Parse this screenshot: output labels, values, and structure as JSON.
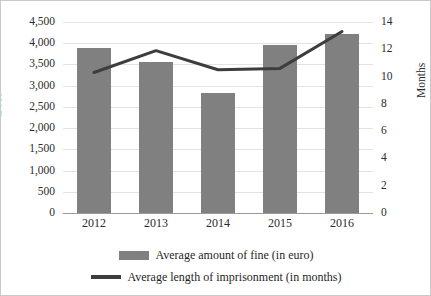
{
  "chart_data": {
    "type": "bar",
    "title": "",
    "categories": [
      "2012",
      "2013",
      "2014",
      "2015",
      "2016"
    ],
    "series": [
      {
        "name": "Average amount of fine (in euro)",
        "type": "bar",
        "axis": "left",
        "color": "#808080",
        "values": [
          3880,
          3550,
          2830,
          3950,
          4220
        ]
      },
      {
        "name": "Average length of imprisonment (in months)",
        "type": "line",
        "axis": "right",
        "color": "#3d3d3d",
        "values": [
          10.3,
          11.9,
          10.5,
          10.6,
          13.3
        ]
      }
    ],
    "xlabel": "",
    "ylabel": "EUR",
    "ylabel_secondary": "Months",
    "ylim": [
      0,
      4500
    ],
    "ylim_secondary": [
      0,
      14
    ],
    "yticks": [
      "0",
      "500",
      "1,000",
      "1,500",
      "2,000",
      "2,500",
      "3,000",
      "3,500",
      "4,000",
      "4,500"
    ],
    "yticks_secondary": [
      "0",
      "2",
      "4",
      "6",
      "8",
      "10",
      "12",
      "14"
    ],
    "grid": true,
    "legend_position": "bottom"
  },
  "legend": {
    "items": [
      {
        "label": "Average amount of fine (in euro)",
        "marker": "bar-swatch"
      },
      {
        "label": "Average length of imprisonment (in months)",
        "marker": "line-swatch"
      }
    ]
  },
  "axes": {
    "left_title": "EUR",
    "right_title": "Months"
  }
}
